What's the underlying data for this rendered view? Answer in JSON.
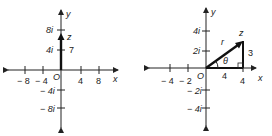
{
  "left": {
    "axis_x": "x",
    "axis_y": "y",
    "origin": "O",
    "x_ticks": [
      "− 8",
      "− 4",
      "4",
      "8"
    ],
    "y_ticks": [
      "8i",
      "4i",
      "− 4i",
      "− 8i"
    ],
    "point_label": "z",
    "length_label": "7",
    "vector": {
      "from": [
        0,
        0
      ],
      "to": [
        0,
        7
      ]
    }
  },
  "right": {
    "axis_x": "x",
    "axis_y": "y",
    "origin": "O",
    "x_ticks": [
      "− 4",
      "− 2",
      "4"
    ],
    "y_ticks": [
      "4i",
      "2i",
      "− 2i",
      "− 4i"
    ],
    "point_label": "z",
    "hyp_label": "r",
    "angle_label": "θ",
    "base_label": "4",
    "height_label": "3",
    "vector": {
      "from": [
        0,
        0
      ],
      "to": [
        4,
        3
      ]
    }
  }
}
